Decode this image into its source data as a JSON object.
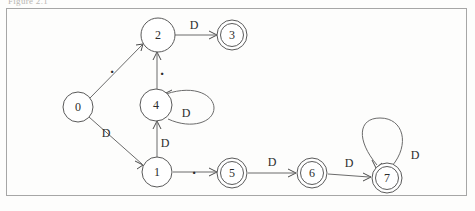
{
  "page": {
    "header_text": "Figure 2.1",
    "frame": {
      "x": 6,
      "y": 8,
      "width": 461,
      "height": 188,
      "border_color": "#a6a6a6"
    },
    "background_color": "#fdfdfc",
    "ink_color": "#5a5a5a",
    "text_color": "#2c2c2c"
  },
  "diagram": {
    "type": "state-transition-diagram",
    "alphabet": [
      "D",
      "."
    ],
    "start_state": "0",
    "accepting_states": [
      "3",
      "5",
      "6",
      "7"
    ],
    "states": [
      {
        "id": "0",
        "label": "0",
        "cx": 78,
        "cy": 107,
        "r": 15,
        "accepting": false
      },
      {
        "id": "1",
        "label": "1",
        "cx": 157,
        "cy": 172,
        "r": 15,
        "accepting": false
      },
      {
        "id": "2",
        "label": "2",
        "cx": 158,
        "cy": 35,
        "r": 17,
        "accepting": false
      },
      {
        "id": "3",
        "label": "3",
        "cx": 232,
        "cy": 35,
        "r": 15,
        "accepting": true
      },
      {
        "id": "4",
        "label": "4",
        "cx": 156,
        "cy": 105,
        "r": 16,
        "accepting": false
      },
      {
        "id": "5",
        "label": "5",
        "cx": 232,
        "cy": 173,
        "r": 15,
        "accepting": true
      },
      {
        "id": "6",
        "label": "6",
        "cx": 312,
        "cy": 173,
        "r": 15,
        "accepting": true
      },
      {
        "id": "7",
        "label": "7",
        "cx": 387,
        "cy": 178,
        "r": 15,
        "accepting": true
      }
    ],
    "transitions": [
      {
        "id": "t0-2",
        "from": "0",
        "to": "2",
        "label": ".",
        "label_x": 112,
        "label_y": 68,
        "kind": "line"
      },
      {
        "id": "t0-1",
        "from": "0",
        "to": "1",
        "label": "D",
        "label_x": 106,
        "label_y": 133,
        "kind": "line"
      },
      {
        "id": "t2-3",
        "from": "2",
        "to": "3",
        "label": "D",
        "label_x": 194,
        "label_y": 25,
        "kind": "line"
      },
      {
        "id": "t4-2",
        "from": "4",
        "to": "2",
        "label": ".",
        "label_x": 162,
        "label_y": 70,
        "kind": "line"
      },
      {
        "id": "t1-4",
        "from": "1",
        "to": "4",
        "label": "D",
        "label_x": 165,
        "label_y": 143,
        "kind": "line"
      },
      {
        "id": "t4-4",
        "from": "4",
        "to": "4",
        "label": "D",
        "label_x": 186,
        "label_y": 113,
        "kind": "self-loop-right"
      },
      {
        "id": "t1-5",
        "from": "1",
        "to": "5",
        "label": ".",
        "label_x": 194,
        "label_y": 169,
        "kind": "line"
      },
      {
        "id": "t5-6",
        "from": "5",
        "to": "6",
        "label": "D",
        "label_x": 272,
        "label_y": 162,
        "kind": "line"
      },
      {
        "id": "t6-7",
        "from": "6",
        "to": "7",
        "label": "D",
        "label_x": 349,
        "label_y": 163,
        "kind": "line"
      },
      {
        "id": "t7-7",
        "from": "7",
        "to": "7",
        "label": "D",
        "label_x": 415,
        "label_y": 155,
        "kind": "self-loop-top"
      }
    ]
  }
}
